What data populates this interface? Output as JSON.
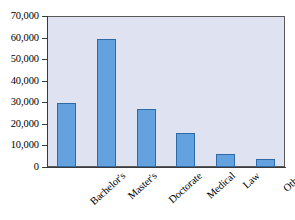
{
  "chart_data": {
    "type": "bar",
    "title": "",
    "subtitle": "",
    "xlabel": "",
    "ylabel": "",
    "categories": [
      "Bachelor's",
      "Master's",
      "Doctorate",
      "Medical",
      "Law",
      "Other"
    ],
    "values": [
      29500,
      59300,
      26800,
      15700,
      5800,
      3500
    ],
    "ylim": [
      0,
      70000
    ],
    "ytick_values": [
      0,
      10000,
      20000,
      30000,
      40000,
      50000,
      60000,
      70000
    ],
    "ytick_labels": [
      "0",
      "10,000",
      "20,000",
      "30,000",
      "40,000",
      "50,000",
      "60,000",
      "70,000"
    ],
    "grid": false,
    "legend": null,
    "legend_position": "none",
    "annotations": [],
    "colors": {
      "bar_fill": "#63a2de",
      "bar_border": "#2f6aa8",
      "plot_background": "#dfe2f0",
      "plot_border": "#595959",
      "axis": "#3a3a3a",
      "text": "#000000",
      "page_background": "#ffffff"
    }
  }
}
